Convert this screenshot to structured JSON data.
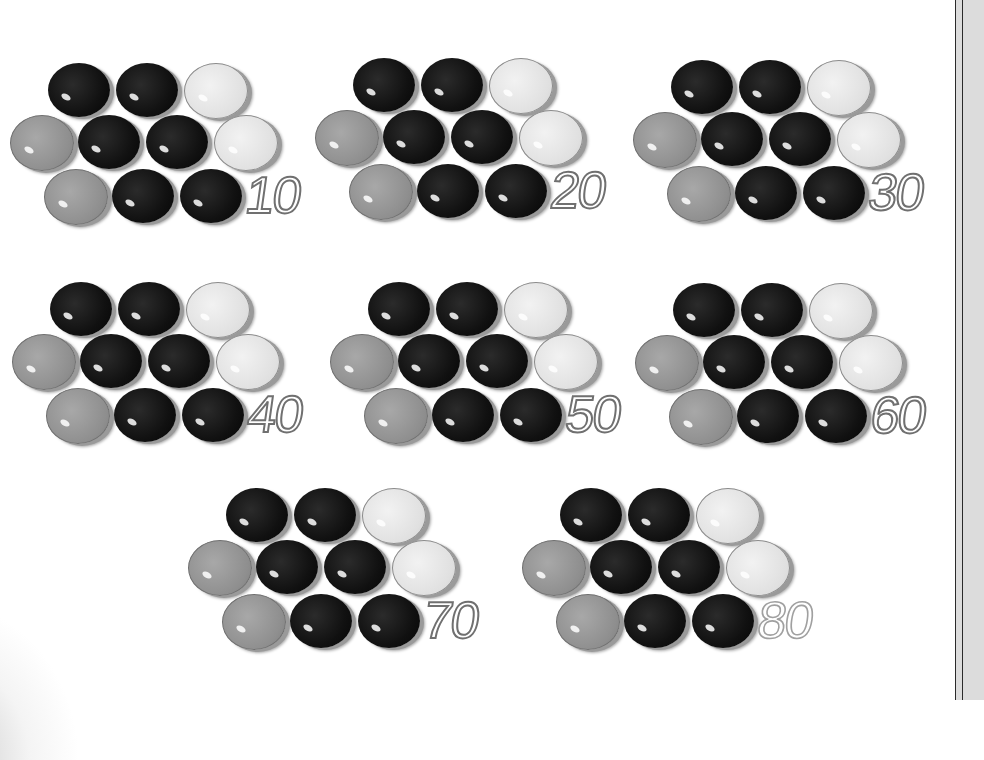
{
  "worksheet": {
    "description": "Counting by tens with counters",
    "counter_colors": {
      "black": "#111111",
      "grey": "#8e8e8e",
      "light": "#e0e0e0"
    },
    "cluster_layout": [
      [
        "black",
        "black",
        "light"
      ],
      [
        "grey",
        "black",
        "black",
        "light"
      ],
      [
        "grey",
        "black",
        "black"
      ]
    ],
    "groups": [
      {
        "label": "10",
        "x": 10,
        "y": 63
      },
      {
        "label": "20",
        "x": 315,
        "y": 58
      },
      {
        "label": "30",
        "x": 633,
        "y": 60
      },
      {
        "label": "40",
        "x": 12,
        "y": 282
      },
      {
        "label": "50",
        "x": 330,
        "y": 282
      },
      {
        "label": "60",
        "x": 635,
        "y": 283
      },
      {
        "label": "70",
        "x": 188,
        "y": 488
      },
      {
        "label": "80",
        "x": 522,
        "y": 488
      }
    ]
  }
}
